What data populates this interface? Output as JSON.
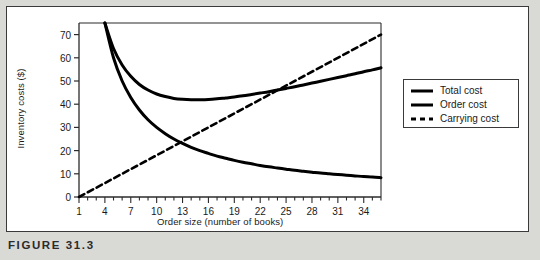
{
  "figure": {
    "caption": "FIGURE 31.3"
  },
  "chart_data": {
    "type": "line",
    "title": "",
    "xlabel": "Order size (number of books)",
    "ylabel": "Inventory costs ($)",
    "xlim": [
      1,
      36
    ],
    "ylim": [
      0,
      75
    ],
    "grid": false,
    "legend_position": "right",
    "xticks": [
      1,
      4,
      7,
      10,
      13,
      16,
      19,
      22,
      25,
      28,
      31,
      34
    ],
    "xtick_labels": [
      "1",
      "4",
      "7",
      "10",
      "13",
      "16",
      "19",
      "22",
      "25",
      "28",
      "31",
      "34"
    ],
    "xminor_step": 1,
    "yticks": [
      0,
      10,
      20,
      30,
      40,
      50,
      60,
      70
    ],
    "ytick_labels": [
      "0",
      "10",
      "20",
      "30",
      "40",
      "50",
      "60",
      "70"
    ],
    "series": [
      {
        "name": "Total cost",
        "style": "solid",
        "width": 3.0,
        "color": "#000000",
        "x": [
          4,
          5,
          6,
          7,
          8,
          9,
          10,
          11,
          12,
          13,
          14,
          15,
          16,
          17,
          18,
          19,
          20,
          21,
          22,
          23,
          24,
          25,
          26,
          27,
          28,
          29,
          30,
          31,
          32,
          33,
          34,
          35,
          36
        ],
        "y": [
          75.0,
          64.0,
          56.9,
          52.0,
          48.5,
          46.1,
          44.4,
          43.3,
          42.5,
          42.1,
          41.9,
          41.9,
          42.0,
          42.3,
          42.7,
          43.1,
          43.6,
          44.2,
          44.8,
          45.4,
          46.1,
          46.8,
          47.5,
          48.3,
          49.1,
          49.9,
          50.7,
          51.5,
          52.3,
          53.1,
          54.0,
          54.8,
          55.7
        ]
      },
      {
        "name": "Order cost",
        "style": "solid",
        "width": 3.0,
        "color": "#000000",
        "x": [
          4,
          5,
          6,
          7,
          8,
          9,
          10,
          11,
          12,
          13,
          14,
          15,
          16,
          17,
          18,
          19,
          20,
          21,
          22,
          23,
          24,
          25,
          26,
          27,
          28,
          29,
          30,
          31,
          32,
          33,
          34,
          35,
          36
        ],
        "y": [
          75.0,
          60.0,
          50.0,
          42.9,
          37.5,
          33.3,
          30.0,
          27.3,
          25.0,
          23.1,
          21.4,
          20.0,
          18.8,
          17.6,
          16.7,
          15.8,
          15.0,
          14.3,
          13.6,
          13.0,
          12.5,
          12.0,
          11.5,
          11.1,
          10.7,
          10.3,
          10.0,
          9.7,
          9.4,
          9.1,
          8.8,
          8.6,
          8.3
        ]
      },
      {
        "name": "Carrying cost",
        "style": "dashed",
        "width": 2.6,
        "color": "#000000",
        "x": [
          1,
          36
        ],
        "y": [
          0.0,
          70.0
        ]
      }
    ],
    "annotations": {
      "optimal_order_size": 13,
      "minimum_total_cost": 41.9,
      "intersection_order_carrying": {
        "x": 11.5,
        "y": 22.0
      }
    }
  },
  "legend": {
    "items": [
      {
        "label": "Total cost",
        "swatch": "thick-solid-line"
      },
      {
        "label": "Order cost",
        "swatch": "thick-solid-line"
      },
      {
        "label": "Carrying cost",
        "swatch": "dashed-line"
      }
    ]
  }
}
